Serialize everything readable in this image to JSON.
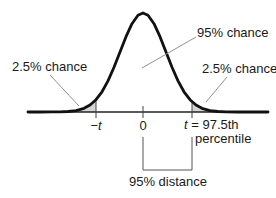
{
  "diagram": {
    "kind": "normal-distribution-percentile",
    "labels": {
      "center_chance": "95% chance",
      "left_tail_chance": "2.5% chance",
      "right_tail_chance": "2.5% chance",
      "neg_sign": "−",
      "t_var": "t",
      "zero": "0",
      "t_equals_rest": " = 97.5th",
      "t_line2": "percentile",
      "distance": "95% distance"
    },
    "colors": {
      "curve": "#111111",
      "axis": "#222222",
      "tail_shade": "#d4d4d4",
      "leader_line": "#909090",
      "bracket": "#555555",
      "text": "#1a1a1a"
    }
  }
}
